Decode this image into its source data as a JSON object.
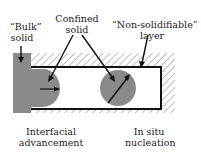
{
  "labels": {
    "bulk_solid": [
      "“Bulk”",
      "solid"
    ],
    "confined_solid": [
      "Confined",
      "solid"
    ],
    "non_solidifiable": [
      "“Non-solidifiable”",
      "layer"
    ],
    "interfacial": [
      "Interfacial",
      "advancement"
    ],
    "in_situ": [
      "In situ",
      "nucleation"
    ]
  },
  "colors": {
    "solid_fill": "#8a8a8a",
    "border": "#111111",
    "hatch": "#bdbdbd",
    "channel": "#ffffff"
  }
}
